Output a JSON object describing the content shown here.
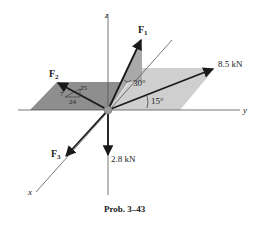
{
  "figure": {
    "caption": "Prob. 3–43",
    "axes": {
      "x": "x",
      "y": "y",
      "z": "z"
    },
    "forces": {
      "F1": {
        "label": "F",
        "sub": "1",
        "angle_label": "30°"
      },
      "F2": {
        "label": "F",
        "sub": "2",
        "slope": {
          "hyp": "25",
          "rise": "7",
          "run": "24"
        }
      },
      "F3": {
        "label": "F",
        "sub": "3"
      },
      "F4": {
        "label": "8.5 kN",
        "angle_label": "15°"
      },
      "F5": {
        "label": "2.8 kN"
      }
    },
    "colors": {
      "dark_plane": "#8e8e8e",
      "mid_plane": "#a9a9a9",
      "light_plane": "#cfcfcf",
      "arrow": "#1a1a1a",
      "axis": "#555555"
    }
  }
}
